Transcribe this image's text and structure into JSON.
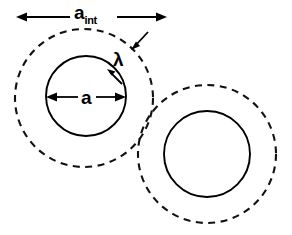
{
  "figure": {
    "title": "",
    "background_color": "#ffffff",
    "line_color": "#000000",
    "width": 292,
    "height": 235,
    "labels": {
      "outer_diameter_symbol": "a",
      "outer_diameter_subscript": "int",
      "core_diameter_symbol": "a",
      "shell_thickness_symbol": "λ"
    },
    "annotations": {
      "top_dimension": {
        "name": "a-int-dimension",
        "label": "a",
        "subscript": "int",
        "style": "double-headed-arrow",
        "orientation": "horizontal",
        "measures": "interaction diameter of the dashed outer circle"
      },
      "core_dimension": {
        "name": "a-dimension",
        "label": "a",
        "style": "double-headed-arrow",
        "orientation": "horizontal",
        "measures": "diameter of the solid inner circle"
      },
      "lambda_leader": {
        "name": "lambda-dimension",
        "label": "λ",
        "style": "two-opposing-arrows",
        "measures": "radial gap between solid inner circle and dashed outer circle"
      }
    },
    "shapes": [
      {
        "name": "left-dashed-circle",
        "type": "circle",
        "line_style": "dashed",
        "cx": 84,
        "cy": 98,
        "r": 69
      },
      {
        "name": "left-solid-circle",
        "type": "circle",
        "line_style": "solid",
        "cx": 86,
        "cy": 96,
        "r": 40
      },
      {
        "name": "right-dashed-circle",
        "type": "circle",
        "line_style": "dashed",
        "cx": 207,
        "cy": 154,
        "r": 69
      },
      {
        "name": "right-solid-circle",
        "type": "circle",
        "line_style": "solid",
        "cx": 207,
        "cy": 154,
        "r": 43
      }
    ]
  }
}
